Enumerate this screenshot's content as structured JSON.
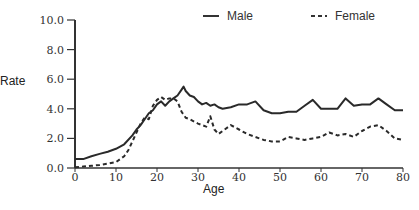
{
  "chart_data": {
    "type": "line",
    "title": "",
    "xlabel": "Age",
    "ylabel": "Rate",
    "xlim": [
      0,
      80
    ],
    "ylim": [
      0,
      10
    ],
    "xticks": [
      0,
      10,
      20,
      30,
      40,
      50,
      60,
      70,
      80
    ],
    "yticks": [
      0,
      2,
      4,
      6,
      8,
      10
    ],
    "ytick_labels": [
      "0.0",
      "2.0",
      "4.0",
      "6.0",
      "8.0",
      "10.0"
    ],
    "grid": false,
    "legend_position": "top-right",
    "series": [
      {
        "name": "Male",
        "style": "solid",
        "x": [
          0,
          2,
          4,
          6,
          8,
          10,
          12,
          14,
          15,
          16,
          17,
          18,
          19,
          20,
          21,
          22,
          23,
          24,
          25,
          26,
          26.5,
          27,
          28,
          29,
          30,
          31,
          32,
          33,
          34,
          35,
          36,
          38,
          40,
          42,
          44,
          46,
          48,
          50,
          52,
          54,
          56,
          58,
          60,
          62,
          64,
          66,
          68,
          70,
          72,
          74,
          76,
          78,
          80
        ],
        "values": [
          0.6,
          0.6,
          0.8,
          0.95,
          1.1,
          1.3,
          1.6,
          2.2,
          2.6,
          2.9,
          3.3,
          3.7,
          3.9,
          4.3,
          4.5,
          4.2,
          4.5,
          4.7,
          4.9,
          5.3,
          5.5,
          5.2,
          4.9,
          4.8,
          4.5,
          4.3,
          4.4,
          4.2,
          4.3,
          4.1,
          4.0,
          4.1,
          4.3,
          4.3,
          4.5,
          3.9,
          3.7,
          3.7,
          3.8,
          3.8,
          4.2,
          4.6,
          4.0,
          4.0,
          4.0,
          4.7,
          4.2,
          4.3,
          4.3,
          4.7,
          4.3,
          3.9,
          3.9
        ]
      },
      {
        "name": "Female",
        "style": "dashed",
        "x": [
          0,
          2,
          4,
          6,
          8,
          10,
          12,
          13,
          14,
          15,
          16,
          17,
          18,
          19,
          20,
          21,
          22,
          23,
          24,
          25,
          26,
          27,
          28,
          30,
          32,
          33,
          34,
          35,
          36,
          38,
          40,
          42,
          44,
          46,
          48,
          50,
          52,
          54,
          56,
          58,
          60,
          62,
          64,
          66,
          68,
          70,
          72,
          74,
          76,
          78,
          80
        ],
        "values": [
          0.05,
          0.1,
          0.15,
          0.2,
          0.3,
          0.4,
          0.8,
          1.2,
          1.8,
          2.4,
          3.0,
          3.4,
          3.3,
          4.2,
          4.6,
          4.8,
          4.6,
          4.7,
          4.7,
          4.5,
          3.8,
          3.4,
          3.3,
          3.0,
          2.8,
          3.5,
          2.6,
          2.3,
          2.5,
          2.9,
          2.6,
          2.3,
          2.1,
          1.9,
          1.8,
          1.8,
          2.1,
          2.0,
          1.9,
          2.0,
          2.1,
          2.4,
          2.2,
          2.3,
          2.1,
          2.5,
          2.8,
          2.9,
          2.5,
          2.0,
          1.9
        ]
      }
    ]
  },
  "legend": {
    "male_label": "Male",
    "female_label": "Female"
  },
  "axes": {
    "x_label": "Age",
    "y_label": "Rate",
    "x_tick_labels": [
      "0",
      "10",
      "20",
      "30",
      "40",
      "50",
      "60",
      "70",
      "80"
    ],
    "y_tick_labels": [
      "0.0",
      "2.0",
      "4.0",
      "6.0",
      "8.0",
      "10.0"
    ]
  }
}
